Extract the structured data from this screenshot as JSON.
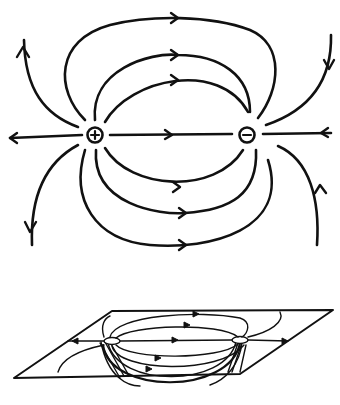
{
  "figure": {
    "top_panel": {
      "description": "Electric field lines of a dipole in plan view",
      "positive_charge": {
        "symbol": "+",
        "x": 95,
        "y": 135
      },
      "negative_charge": {
        "symbol": "−",
        "x": 247,
        "y": 135
      }
    },
    "bottom_panel": {
      "description": "Perspective view of dipole field lines on a plane with lines continuing below"
    },
    "colors": {
      "ink": "#111111",
      "background": "#ffffff"
    }
  }
}
